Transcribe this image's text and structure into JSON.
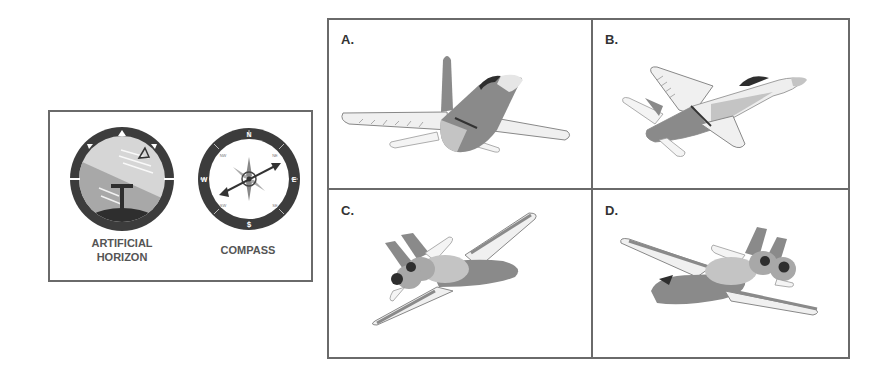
{
  "instruments": {
    "artificial_horizon": {
      "label_line1": "ARTIFICIAL",
      "label_line2": "HORIZON"
    },
    "compass": {
      "label": "COMPASS",
      "cardinals": {
        "n": "N",
        "e": "E",
        "s": "S",
        "w": "W"
      },
      "intercardinals": {
        "nw": "NW",
        "ne": "NE",
        "sw": "SW",
        "se": "SE"
      }
    }
  },
  "options": [
    {
      "label": "A.",
      "description": "aircraft viewed from behind, rolled slightly, pitched up"
    },
    {
      "label": "B.",
      "description": "aircraft climbing to the right"
    },
    {
      "label": "C.",
      "description": "aircraft viewed from behind-left, banking left"
    },
    {
      "label": "D.",
      "description": "aircraft viewed from behind-right, banking right"
    }
  ],
  "colors": {
    "border": "#6a6a6a",
    "instrument_bezel": "#3c3c3c",
    "sky": "#d6d6d6",
    "ground": "#a8a8a8",
    "fuselage_dark": "#8a8a8a",
    "fuselage_light": "#c4c4c4",
    "wing_light": "#efefef"
  }
}
